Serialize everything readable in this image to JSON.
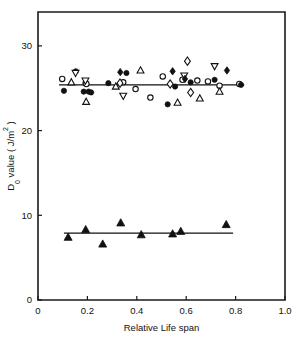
{
  "chart_data": {
    "type": "scatter",
    "title": "",
    "xlabel": "Relative Life span",
    "ylabel": "D0 value ( J/m2 )",
    "ylabel_parts": {
      "main": "D",
      "sub": "0",
      "mid": " value  (  J/m",
      "sup": "2",
      "end": " )"
    },
    "xlim": [
      0,
      1.0
    ],
    "ylim": [
      0,
      34
    ],
    "xticks": [
      0,
      0.2,
      0.4,
      0.6,
      0.8,
      1.0
    ],
    "xtick_labels": [
      "0",
      "0.2",
      "0.4",
      "0.6",
      "0.8",
      "1.0"
    ],
    "yticks": [
      0,
      10,
      20,
      30
    ],
    "ytick_labels": [
      "0",
      "10",
      "20",
      "30"
    ],
    "grid": false,
    "legend": "none",
    "frame": "box",
    "fit_lines": [
      {
        "name": "upper-fit",
        "y": 25.4,
        "x_start": 0.085,
        "x_end": 0.835
      },
      {
        "name": "lower-fit",
        "y": 7.9,
        "x_start": 0.105,
        "x_end": 0.79
      }
    ],
    "series": [
      {
        "name": "open-circle",
        "marker": "circle-open",
        "points": [
          {
            "x": 0.098,
            "y": 26.1
          },
          {
            "x": 0.193,
            "y": 25.6
          },
          {
            "x": 0.196,
            "y": 25.5
          },
          {
            "x": 0.345,
            "y": 25.7
          },
          {
            "x": 0.395,
            "y": 24.9
          },
          {
            "x": 0.455,
            "y": 23.9
          },
          {
            "x": 0.505,
            "y": 26.4
          },
          {
            "x": 0.585,
            "y": 26.0
          },
          {
            "x": 0.645,
            "y": 25.9
          },
          {
            "x": 0.688,
            "y": 25.8
          },
          {
            "x": 0.735,
            "y": 25.3
          },
          {
            "x": 0.815,
            "y": 25.5
          }
        ]
      },
      {
        "name": "filled-circle",
        "marker": "circle-filled",
        "points": [
          {
            "x": 0.105,
            "y": 24.7
          },
          {
            "x": 0.153,
            "y": 27.0
          },
          {
            "x": 0.185,
            "y": 24.6
          },
          {
            "x": 0.205,
            "y": 24.6
          },
          {
            "x": 0.215,
            "y": 24.5
          },
          {
            "x": 0.285,
            "y": 25.6
          },
          {
            "x": 0.358,
            "y": 26.8
          },
          {
            "x": 0.525,
            "y": 23.1
          },
          {
            "x": 0.555,
            "y": 25.2
          },
          {
            "x": 0.618,
            "y": 25.7
          },
          {
            "x": 0.715,
            "y": 26.0
          },
          {
            "x": 0.822,
            "y": 25.4
          }
        ]
      },
      {
        "name": "open-triangle-up",
        "marker": "triangle-up-open",
        "points": [
          {
            "x": 0.135,
            "y": 25.7
          },
          {
            "x": 0.195,
            "y": 23.4
          },
          {
            "x": 0.315,
            "y": 25.2
          },
          {
            "x": 0.415,
            "y": 27.1
          },
          {
            "x": 0.565,
            "y": 23.3
          },
          {
            "x": 0.655,
            "y": 23.8
          },
          {
            "x": 0.735,
            "y": 24.6
          }
        ]
      },
      {
        "name": "open-triangle-down",
        "marker": "triangle-down-open",
        "points": [
          {
            "x": 0.152,
            "y": 26.8
          },
          {
            "x": 0.192,
            "y": 25.9
          },
          {
            "x": 0.345,
            "y": 24.1
          },
          {
            "x": 0.592,
            "y": 26.5
          },
          {
            "x": 0.715,
            "y": 27.6
          }
        ]
      },
      {
        "name": "open-diamond",
        "marker": "diamond-open",
        "points": [
          {
            "x": 0.332,
            "y": 25.6
          },
          {
            "x": 0.535,
            "y": 25.5
          },
          {
            "x": 0.605,
            "y": 28.2
          },
          {
            "x": 0.618,
            "y": 24.5
          }
        ]
      },
      {
        "name": "filled-diamond",
        "marker": "diamond-filled",
        "points": [
          {
            "x": 0.333,
            "y": 26.9
          },
          {
            "x": 0.545,
            "y": 27.0
          },
          {
            "x": 0.595,
            "y": 26.1
          },
          {
            "x": 0.765,
            "y": 27.1
          }
        ]
      },
      {
        "name": "filled-triangle-lower",
        "marker": "triangle-up-filled",
        "points": [
          {
            "x": 0.122,
            "y": 7.4
          },
          {
            "x": 0.193,
            "y": 8.3
          },
          {
            "x": 0.262,
            "y": 6.6
          },
          {
            "x": 0.335,
            "y": 9.1
          },
          {
            "x": 0.418,
            "y": 7.7
          },
          {
            "x": 0.545,
            "y": 7.8
          },
          {
            "x": 0.578,
            "y": 8.1
          },
          {
            "x": 0.762,
            "y": 8.9
          }
        ]
      }
    ]
  }
}
